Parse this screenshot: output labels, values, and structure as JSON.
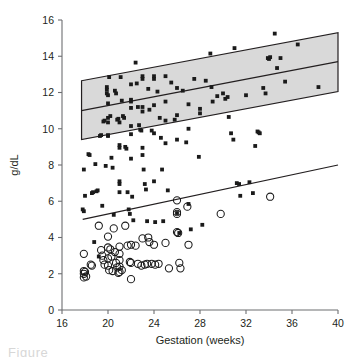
{
  "chart_data": {
    "type": "scatter",
    "title": "",
    "xlabel": "Gestation (weeks)",
    "ylabel": "g/dL",
    "xlim": [
      16,
      40
    ],
    "ylim": [
      0,
      16
    ],
    "xticks": [
      16,
      20,
      24,
      28,
      32,
      36,
      40
    ],
    "yticks": [
      0,
      2,
      4,
      6,
      8,
      10,
      12,
      14,
      16
    ],
    "grid": false,
    "legend_position": "none",
    "series": [
      {
        "name": "filled-squares",
        "marker": "square",
        "marker_color": "#1a1a1a",
        "points": [
          [
            17.9,
            7.75
          ],
          [
            17.8,
            5.55
          ],
          [
            17.9,
            5.45
          ],
          [
            18.0,
            6.3
          ],
          [
            18.3,
            8.6
          ],
          [
            18.4,
            8.55
          ],
          [
            18.6,
            6.45
          ],
          [
            18.7,
            6.5
          ],
          [
            18.8,
            3.75
          ],
          [
            18.9,
            8.05
          ],
          [
            19.0,
            6.55
          ],
          [
            19.1,
            6.6
          ],
          [
            19.2,
            2.95
          ],
          [
            19.3,
            9.6
          ],
          [
            19.4,
            9.65
          ],
          [
            19.5,
            5.75
          ],
          [
            19.6,
            10.4
          ],
          [
            19.7,
            10.45
          ],
          [
            19.8,
            7.95
          ],
          [
            19.9,
            12.3
          ],
          [
            19.9,
            12.15
          ],
          [
            19.9,
            11.95
          ],
          [
            20.0,
            11.85
          ],
          [
            20.0,
            11.4
          ],
          [
            20.0,
            10.6
          ],
          [
            20.0,
            10.35
          ],
          [
            20.0,
            9.6
          ],
          [
            20.0,
            9.65
          ],
          [
            20.1,
            12.85
          ],
          [
            20.2,
            10.7
          ],
          [
            20.3,
            8.4
          ],
          [
            20.4,
            7.85
          ],
          [
            20.5,
            5.25
          ],
          [
            20.6,
            12.1
          ],
          [
            20.7,
            11.95
          ],
          [
            20.8,
            10.5
          ],
          [
            20.9,
            10.55
          ],
          [
            21.0,
            10.35
          ],
          [
            21.0,
            9.1
          ],
          [
            21.0,
            8.95
          ],
          [
            21.0,
            7.1
          ],
          [
            21.0,
            6.95
          ],
          [
            21.0,
            6.5
          ],
          [
            21.1,
            12.85
          ],
          [
            21.2,
            11.55
          ],
          [
            21.3,
            10.7
          ],
          [
            21.4,
            10.6
          ],
          [
            21.5,
            9.0
          ],
          [
            21.6,
            8.9
          ],
          [
            21.7,
            6.5
          ],
          [
            21.8,
            5.55
          ],
          [
            21.9,
            5.3
          ],
          [
            22.0,
            12.45
          ],
          [
            22.0,
            11.6
          ],
          [
            22.0,
            11.5
          ],
          [
            22.0,
            11.15
          ],
          [
            22.0,
            10.15
          ],
          [
            22.0,
            9.7
          ],
          [
            22.0,
            8.35
          ],
          [
            22.1,
            6.25
          ],
          [
            22.2,
            4.95
          ],
          [
            22.4,
            13.65
          ],
          [
            22.5,
            12.5
          ],
          [
            22.6,
            11.2
          ],
          [
            22.7,
            10.2
          ],
          [
            22.8,
            9.95
          ],
          [
            22.9,
            9.9
          ],
          [
            23.0,
            12.9
          ],
          [
            23.0,
            12.75
          ],
          [
            23.0,
            11.2
          ],
          [
            23.0,
            10.95
          ],
          [
            23.0,
            8.95
          ],
          [
            23.0,
            8.55
          ],
          [
            23.1,
            7.75
          ],
          [
            23.2,
            6.95
          ],
          [
            23.3,
            6.65
          ],
          [
            23.4,
            4.9
          ],
          [
            23.5,
            12.2
          ],
          [
            23.6,
            11.05
          ],
          [
            23.8,
            9.9
          ],
          [
            24.0,
            12.9
          ],
          [
            24.0,
            12.75
          ],
          [
            24.0,
            11.3
          ],
          [
            24.0,
            9.75
          ],
          [
            24.0,
            7.1
          ],
          [
            24.1,
            4.85
          ],
          [
            24.3,
            12.05
          ],
          [
            24.5,
            10.6
          ],
          [
            24.6,
            9.5
          ],
          [
            24.7,
            7.75
          ],
          [
            24.8,
            4.9
          ],
          [
            25.0,
            12.9
          ],
          [
            25.0,
            11.5
          ],
          [
            25.0,
            10.45
          ],
          [
            25.0,
            9.2
          ],
          [
            25.2,
            6.6
          ],
          [
            25.5,
            12.55
          ],
          [
            25.8,
            10.5
          ],
          [
            26.0,
            12.25
          ],
          [
            26.0,
            10.75
          ],
          [
            26.0,
            9.4
          ],
          [
            26.0,
            5.35
          ],
          [
            26.2,
            4.25
          ],
          [
            26.5,
            12.1
          ],
          [
            26.8,
            9.25
          ],
          [
            27.0,
            11.35
          ],
          [
            27.0,
            10.0
          ],
          [
            27.0,
            5.85
          ],
          [
            27.2,
            4.45
          ],
          [
            27.5,
            12.75
          ],
          [
            27.9,
            8.45
          ],
          [
            28.0,
            11.1
          ],
          [
            28.0,
            10.85
          ],
          [
            28.2,
            4.7
          ],
          [
            28.5,
            12.65
          ],
          [
            28.9,
            14.15
          ],
          [
            29.0,
            12.3
          ],
          [
            29.1,
            11.5
          ],
          [
            29.5,
            11.8
          ],
          [
            30.0,
            11.95
          ],
          [
            30.2,
            11.65
          ],
          [
            30.4,
            11.75
          ],
          [
            30.5,
            10.65
          ],
          [
            30.7,
            9.75
          ],
          [
            30.9,
            9.4
          ],
          [
            31.0,
            14.45
          ],
          [
            31.2,
            7.0
          ],
          [
            31.4,
            6.95
          ],
          [
            31.5,
            6.3
          ],
          [
            32.0,
            11.85
          ],
          [
            32.3,
            7.05
          ],
          [
            32.6,
            6.45
          ],
          [
            32.8,
            9.05
          ],
          [
            33.0,
            9.85
          ],
          [
            33.1,
            9.8
          ],
          [
            33.2,
            9.75
          ],
          [
            33.5,
            12.25
          ],
          [
            33.7,
            11.95
          ],
          [
            33.9,
            13.9
          ],
          [
            34.0,
            13.85
          ],
          [
            34.1,
            13.95
          ],
          [
            34.5,
            15.25
          ],
          [
            34.7,
            13.35
          ],
          [
            35.0,
            13.9
          ],
          [
            35.4,
            12.6
          ],
          [
            36.5,
            14.65
          ],
          [
            38.3,
            12.3
          ]
        ]
      },
      {
        "name": "open-circles",
        "marker": "circle",
        "marker_color": "#1a1a1a",
        "points": [
          [
            17.9,
            3.1
          ],
          [
            17.9,
            2.15
          ],
          [
            17.9,
            2.0
          ],
          [
            17.9,
            1.8
          ],
          [
            18.0,
            2.1
          ],
          [
            18.1,
            1.85
          ],
          [
            18.5,
            2.5
          ],
          [
            18.6,
            2.45
          ],
          [
            19.2,
            4.65
          ],
          [
            19.4,
            3.3
          ],
          [
            19.5,
            3.0
          ],
          [
            19.6,
            2.75
          ],
          [
            19.7,
            2.5
          ],
          [
            20.0,
            4.05
          ],
          [
            20.0,
            3.45
          ],
          [
            20.0,
            2.85
          ],
          [
            20.0,
            2.45
          ],
          [
            20.1,
            2.2
          ],
          [
            20.2,
            3.35
          ],
          [
            20.3,
            2.95
          ],
          [
            20.4,
            2.15
          ],
          [
            20.5,
            4.5
          ],
          [
            20.6,
            3.2
          ],
          [
            20.7,
            2.6
          ],
          [
            20.8,
            2.35
          ],
          [
            20.9,
            2.05
          ],
          [
            21.0,
            3.5
          ],
          [
            21.0,
            3.1
          ],
          [
            21.0,
            2.75
          ],
          [
            21.0,
            2.4
          ],
          [
            21.0,
            2.1
          ],
          [
            21.2,
            2.2
          ],
          [
            21.5,
            4.65
          ],
          [
            21.7,
            3.55
          ],
          [
            21.9,
            2.65
          ],
          [
            22.0,
            3.6
          ],
          [
            22.0,
            2.6
          ],
          [
            22.0,
            1.7
          ],
          [
            22.4,
            3.55
          ],
          [
            22.6,
            2.55
          ],
          [
            22.9,
            2.45
          ],
          [
            23.0,
            3.95
          ],
          [
            23.2,
            2.5
          ],
          [
            23.4,
            2.55
          ],
          [
            23.5,
            4.0
          ],
          [
            23.6,
            3.75
          ],
          [
            23.8,
            2.55
          ],
          [
            24.0,
            3.6
          ],
          [
            24.1,
            2.5
          ],
          [
            24.4,
            2.55
          ],
          [
            25.0,
            3.7
          ],
          [
            25.3,
            2.3
          ],
          [
            26.0,
            6.05
          ],
          [
            26.0,
            5.4
          ],
          [
            26.0,
            5.3
          ],
          [
            26.0,
            4.3
          ],
          [
            26.1,
            4.25
          ],
          [
            26.2,
            2.6
          ],
          [
            26.3,
            2.3
          ],
          [
            26.9,
            5.7
          ],
          [
            27.0,
            3.6
          ],
          [
            29.8,
            5.3
          ],
          [
            34.1,
            6.25
          ]
        ]
      }
    ],
    "shaded_band": {
      "name": "reference-range-band",
      "fill_color": "#d9d9d9",
      "edge_color": "#231f20",
      "x_start": 17.7,
      "x_end": 40.0,
      "upper_start": 12.65,
      "upper_end": 15.3,
      "lower_start": 9.4,
      "lower_end": 12.05,
      "center_start": 11.0,
      "center_end": 13.7
    },
    "trend_line": {
      "name": "lower-regression-line",
      "color": "#231f20",
      "x_start": 17.8,
      "x_end": 40.0,
      "y_start": 5.0,
      "y_end": 8.0
    }
  },
  "axes": {
    "y_title": "g/dL",
    "x_title": "Gestation (weeks)",
    "x_tick_labels": [
      "16",
      "20",
      "24",
      "28",
      "32",
      "36",
      "40"
    ],
    "y_tick_labels": [
      "0",
      "2",
      "4",
      "6",
      "8",
      "10",
      "12",
      "14",
      "16"
    ]
  },
  "caption": {
    "partial_text": "Figure"
  },
  "colors": {
    "axis": "#6d6e71",
    "marker": "#1a1a1a",
    "band_fill": "#d9d9d9",
    "band_edge": "#231f20",
    "text": "#231f20"
  }
}
